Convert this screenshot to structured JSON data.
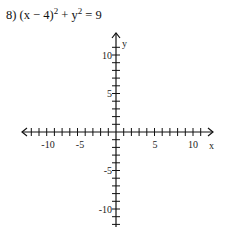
{
  "problem": {
    "number": "8)",
    "lhs_a": "(x − 4)",
    "exp_a": "2",
    "plus": " + y",
    "exp_b": "2",
    "rhs": " = 9"
  },
  "chart_data": {
    "type": "scatter",
    "xlabel": "x",
    "ylabel": "y",
    "xlim": [
      -12,
      12
    ],
    "ylim": [
      -12,
      12
    ],
    "x_ticks": [
      -10,
      -5,
      5,
      10
    ],
    "y_ticks": [
      10,
      5,
      -5,
      -10
    ],
    "x_tick_labels": [
      "-10",
      "-5",
      "5",
      "10"
    ],
    "y_tick_labels": [
      "10",
      "5",
      "-5",
      "-10"
    ],
    "tick_step": 1,
    "grid": false,
    "series": []
  },
  "axes": {
    "x_label": "x",
    "y_label": "y",
    "x_labels": [
      "-10",
      "-5",
      "5",
      "10"
    ],
    "y_labels": [
      "10",
      "5",
      "-5",
      "-10"
    ]
  },
  "colors": {
    "axis": "#111111",
    "text": "#222222",
    "background": "#ffffff"
  }
}
